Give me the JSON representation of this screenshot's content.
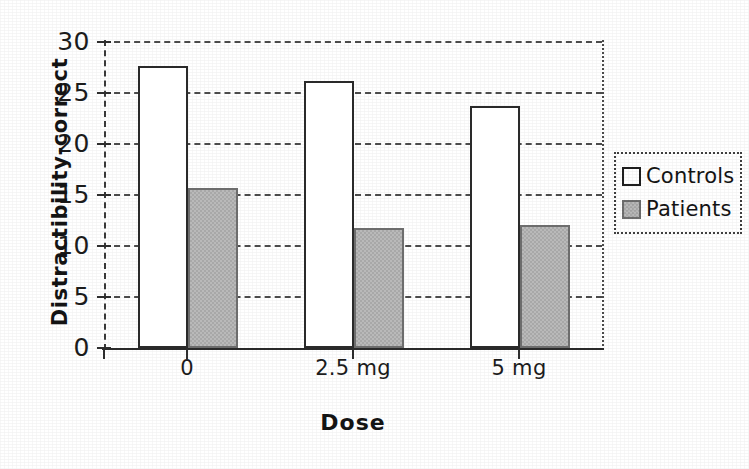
{
  "chart_data": {
    "type": "bar",
    "title": "",
    "xlabel": "Dose",
    "ylabel": "Distractibility-correct",
    "categories": [
      "0",
      "2.5 mg",
      "5 mg"
    ],
    "series": [
      {
        "name": "Controls",
        "values": [
          27.6,
          26.2,
          23.7
        ],
        "fill": "#ffffff",
        "stroke": "#2a2a2a"
      },
      {
        "name": "Patients",
        "values": [
          15.7,
          11.8,
          12.1
        ],
        "fill": "#b9b9b9",
        "stroke": "#6d6d6d"
      }
    ],
    "ylim": [
      0,
      30
    ],
    "ytick_values": [
      30,
      25,
      20,
      15,
      10,
      5,
      0
    ],
    "ytick_labels": [
      "30",
      "25",
      "20",
      "15",
      "10",
      "5",
      "0"
    ],
    "grid": true,
    "grid_style": "dashed",
    "legend_position": "right",
    "legend_entries": [
      "Controls",
      "Patients"
    ]
  },
  "axes": {
    "y_title": "Distractibility-correct",
    "x_title": "Dose"
  },
  "legend": {
    "items": [
      {
        "label": "Controls",
        "swatch": "open-square-swatch"
      },
      {
        "label": "Patients",
        "swatch": "gray-square-swatch"
      }
    ]
  }
}
